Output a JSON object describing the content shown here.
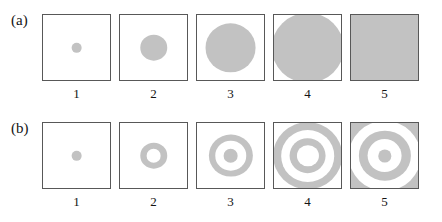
{
  "figure": {
    "width": 442,
    "height": 222,
    "background": "#ffffff",
    "gray": "#c2c2c2",
    "border_color": "#585858",
    "rows": [
      {
        "label": "(a)",
        "name": "row-a",
        "description": "solid gray disks of increasing radius",
        "panels": [
          {
            "caption": "1",
            "type": "disk",
            "rings": [
              {
                "diameter_pct": 16,
                "color": "gray"
              }
            ]
          },
          {
            "caption": "2",
            "type": "disk",
            "rings": [
              {
                "diameter_pct": 41,
                "color": "gray"
              }
            ]
          },
          {
            "caption": "3",
            "type": "disk",
            "rings": [
              {
                "diameter_pct": 76,
                "color": "gray"
              }
            ]
          },
          {
            "caption": "4",
            "type": "disk",
            "rings": [
              {
                "diameter_pct": 108,
                "color": "gray"
              }
            ]
          },
          {
            "caption": "5",
            "type": "filled-square",
            "rings": [
              {
                "diameter_pct": 100,
                "color": "gray"
              }
            ]
          }
        ]
      },
      {
        "label": "(b)",
        "name": "row-b",
        "description": "concentric gray rings (Bessel / zone-plate pattern) of increasing order",
        "panels": [
          {
            "caption": "1",
            "type": "disk",
            "rings": [
              {
                "diameter_pct": 16,
                "color": "gray"
              }
            ]
          },
          {
            "caption": "2",
            "type": "annulus",
            "rings": [
              {
                "diameter_pct": 41,
                "color": "gray"
              },
              {
                "diameter_pct": 22,
                "color": "white"
              }
            ]
          },
          {
            "caption": "3",
            "type": "annulus-with-core",
            "rings": [
              {
                "diameter_pct": 66,
                "color": "gray"
              },
              {
                "diameter_pct": 47,
                "color": "white"
              },
              {
                "diameter_pct": 22,
                "color": "gray"
              }
            ]
          },
          {
            "caption": "4",
            "type": "double-annulus",
            "rings": [
              {
                "diameter_pct": 104,
                "color": "gray"
              },
              {
                "diameter_pct": 80,
                "color": "white"
              },
              {
                "diameter_pct": 55,
                "color": "gray"
              },
              {
                "diameter_pct": 33,
                "color": "white"
              }
            ]
          },
          {
            "caption": "5",
            "type": "double-annulus-with-core",
            "rings": [
              {
                "diameter_pct": 135,
                "color": "gray"
              },
              {
                "diameter_pct": 108,
                "color": "white"
              },
              {
                "diameter_pct": 78,
                "color": "gray"
              },
              {
                "diameter_pct": 52,
                "color": "white"
              },
              {
                "diameter_pct": 20,
                "color": "gray"
              }
            ]
          }
        ]
      }
    ]
  }
}
